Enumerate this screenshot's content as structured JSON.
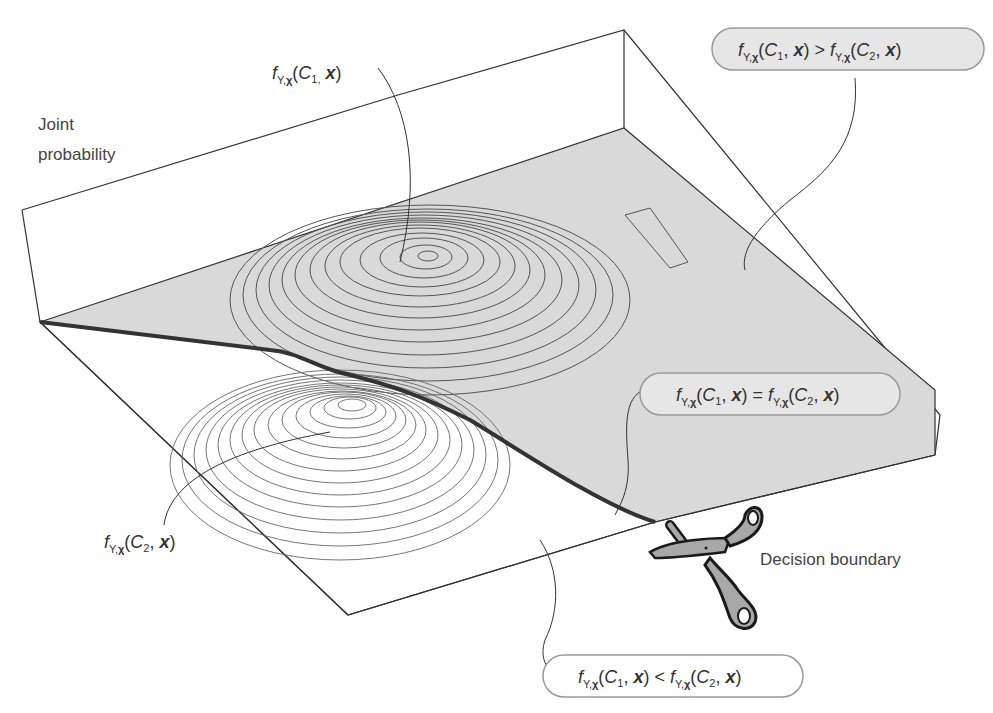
{
  "diagram": {
    "axis_label": {
      "line1": "Joint",
      "line2": "probability"
    },
    "labels": {
      "class1_density": {
        "f": "f",
        "sub": "Y,",
        "subbold": "χ",
        "args_open": "(",
        "C": "C",
        "Csub": "1,",
        "x": "x",
        "close": ")"
      },
      "class2_density": {
        "f": "f",
        "sub": "Y,",
        "subbold": "χ",
        "args_open": "(",
        "C": "C",
        "Csub": "2",
        "comma": ",",
        "x": "x",
        "close": ")"
      },
      "decision_boundary": "Decision boundary"
    },
    "callouts": [
      {
        "id": "greater",
        "relation": ">",
        "text_left": "(C₁, x)",
        "text_right": "(C₂, x)",
        "bg": "#e6e6e6"
      },
      {
        "id": "equal",
        "relation": "=",
        "text_left": "(C₁, x)",
        "text_right": "(C₂, x)",
        "bg": "#e6e6e6"
      },
      {
        "id": "less",
        "relation": "<",
        "text_left": "(C₁, x)",
        "text_right": "(C₂, x)",
        "bg": "#ffffff"
      }
    ],
    "colors": {
      "floor_fill": "#d9d9d9",
      "boundary": "#333333",
      "scissors_fill": "#a8a8a8",
      "scissors_stroke": "#1a1a1a"
    },
    "icons": [
      "scissors-icon"
    ]
  }
}
